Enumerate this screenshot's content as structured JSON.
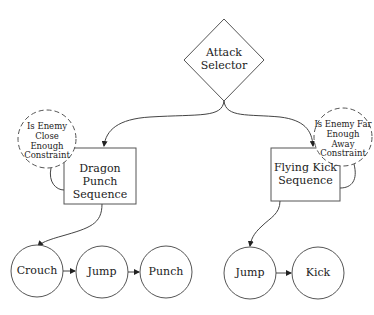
{
  "colors": {
    "stroke": "#444444",
    "text": "#222222",
    "background": "#ffffff"
  },
  "selector": {
    "label_line1": "Attack",
    "label_line2": "Selector",
    "shape": "diamond"
  },
  "sequences": [
    {
      "label_line1": "Dragon Punch",
      "label_line2": "Sequence",
      "constraint": {
        "line1": "Is Enemy",
        "line2": "Close Enough",
        "line3": "Constraint"
      },
      "actions": [
        "Crouch",
        "Jump",
        "Punch"
      ]
    },
    {
      "label_line1": "Flying Kick",
      "label_line2": "Sequence",
      "constraint": {
        "line1": "Is Enemy Far",
        "line2": "Enough Away",
        "line3": "Constraint"
      },
      "actions": [
        "Jump",
        "Kick"
      ]
    }
  ]
}
